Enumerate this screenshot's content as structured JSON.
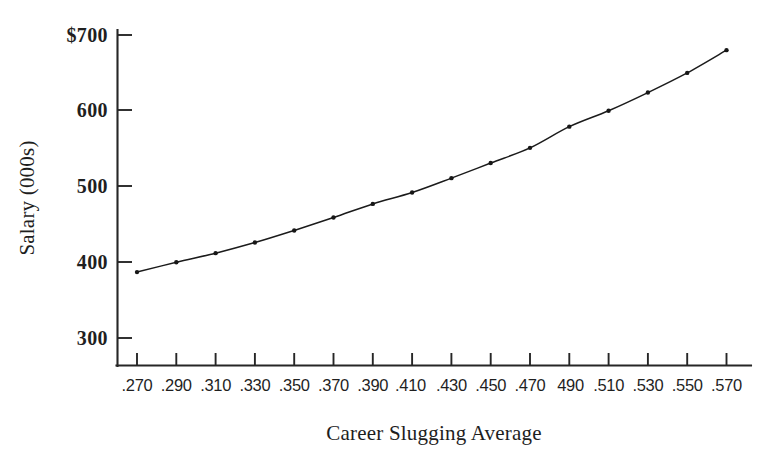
{
  "chart_data": {
    "type": "line",
    "title": "",
    "subtitle": "",
    "xlabel": "Career Slugging Average",
    "ylabel": "Salary (000s)",
    "xlim": [
      0.26,
      0.58
    ],
    "ylim": [
      300,
      700
    ],
    "grid": false,
    "legend": null,
    "legend_position": "none",
    "y_tick_labels": [
      "$700",
      "600",
      "500",
      "400",
      "300"
    ],
    "y_tick_values": [
      700,
      600,
      500,
      400,
      300
    ],
    "y_axis_currency_prefix": "$",
    "y_axis_units": "thousands of dollars",
    "x_tick_labels": [
      ".270",
      ".290",
      ".310",
      ".330",
      ".350",
      ".370",
      ".390",
      ".410",
      ".430",
      ".450",
      "490",
      ".510",
      ".530",
      ".550",
      ".570"
    ],
    "x_tick_labels_full": [
      ".270",
      ".290",
      ".310",
      ".330",
      ".350",
      ".370",
      ".390",
      ".410",
      ".430",
      ".450",
      ".470",
      ".490",
      ".510",
      ".530",
      ".550",
      ".570"
    ],
    "x": [
      0.27,
      0.29,
      0.31,
      0.33,
      0.35,
      0.37,
      0.39,
      0.41,
      0.43,
      0.45,
      0.47,
      0.49,
      0.51,
      0.53,
      0.55,
      0.57
    ],
    "values": [
      387,
      400,
      412,
      426,
      442,
      459,
      477,
      492,
      511,
      531,
      551,
      579,
      600,
      624,
      650,
      680
    ],
    "series": [
      {
        "name": "Predicted Salary",
        "marker": "dot",
        "line_style": "solid",
        "color": "#1b1b1b",
        "values": [
          387,
          400,
          412,
          426,
          442,
          459,
          477,
          492,
          511,
          531,
          551,
          579,
          600,
          624,
          650,
          680
        ]
      }
    ],
    "n_points": 16,
    "point_labels": [
      {
        "x": ".270",
        "y": 387
      },
      {
        "x": ".290",
        "y": 400
      },
      {
        "x": ".310",
        "y": 412
      },
      {
        "x": ".330",
        "y": 426
      },
      {
        "x": ".350",
        "y": 442
      },
      {
        "x": ".370",
        "y": 459
      },
      {
        "x": ".390",
        "y": 477
      },
      {
        "x": ".410",
        "y": 492
      },
      {
        "x": ".430",
        "y": 511
      },
      {
        "x": ".450",
        "y": 531
      },
      {
        "x": ".470",
        "y": 551
      },
      {
        "x": ".490",
        "y": 579
      },
      {
        "x": ".510",
        "y": 600
      },
      {
        "x": ".530",
        "y": 624
      },
      {
        "x": ".550",
        "y": 650
      },
      {
        "x": ".570",
        "y": 680
      }
    ]
  },
  "axes": {
    "y_title": "Salary (000s)",
    "x_title": "Career Slugging Average"
  },
  "colors": {
    "axis": "#262626",
    "curve": "#1b1b1b",
    "marker": "#171717",
    "text": "#1f1f1f",
    "background": "#ffffff"
  }
}
